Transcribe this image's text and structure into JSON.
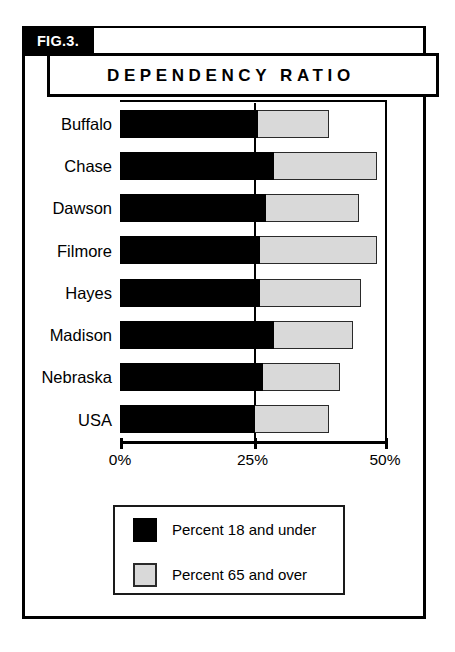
{
  "figure": {
    "tab_label": "FIG.3.",
    "title": "DEPENDENCY RATIO"
  },
  "axis": {
    "tick_labels": [
      "0%",
      "25%",
      "50%"
    ]
  },
  "legend": {
    "items": [
      {
        "label": "Percent 18 and under",
        "swatch": "black-swatch-icon",
        "color": "#000000"
      },
      {
        "label": "Percent 65 and over",
        "swatch": "gray-swatch-icon",
        "color": "#d9d9d9"
      }
    ]
  },
  "chart_data": {
    "type": "bar",
    "orientation": "horizontal",
    "stacked": true,
    "title": "DEPENDENCY RATIO",
    "xlabel": "",
    "ylabel": "",
    "xlim": [
      0,
      50
    ],
    "xticks": [
      0,
      25,
      50
    ],
    "xtick_labels": [
      "0%",
      "25%",
      "50%"
    ],
    "grid": false,
    "gridlines_at": [
      25
    ],
    "legend_position": "below-plot",
    "categories": [
      "Buffalo",
      "Chase",
      "Dawson",
      "Filmore",
      "Hayes",
      "Madison",
      "Nebraska",
      "USA"
    ],
    "series": [
      {
        "name": "Percent 18 and under",
        "color": "#000000",
        "values": [
          26.0,
          29.0,
          27.5,
          26.5,
          26.5,
          29.0,
          27.0,
          25.5
        ]
      },
      {
        "name": "Percent 65 and over",
        "color": "#d9d9d9",
        "values": [
          13.5,
          19.5,
          17.5,
          22.0,
          19.0,
          15.0,
          14.5,
          14.0
        ]
      }
    ],
    "totals": [
      39.5,
      48.5,
      45.0,
      48.5,
      45.5,
      44.0,
      41.5,
      39.5
    ]
  }
}
